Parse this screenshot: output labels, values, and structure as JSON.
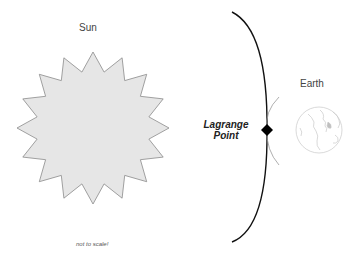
{
  "diagram": {
    "labels": {
      "sun": "Sun",
      "earth": "Earth",
      "lagrange_line1": "Lagrange",
      "lagrange_line2": "Point",
      "note": "not to scale!"
    },
    "nodes": [
      {
        "id": "sun",
        "shape": "16-point star",
        "fill": "#e6e6e6",
        "stroke": "#888888"
      },
      {
        "id": "lagrange-point",
        "shape": "diamond",
        "fill": "#000000"
      },
      {
        "id": "earth",
        "shape": "globe outline",
        "stroke": "#cccccc"
      }
    ],
    "edges": [
      {
        "id": "orbit-curve",
        "shape": "arc",
        "stroke": "#111111"
      },
      {
        "id": "earth-gravity-arc",
        "shape": "arc",
        "stroke": "#999999"
      }
    ]
  }
}
